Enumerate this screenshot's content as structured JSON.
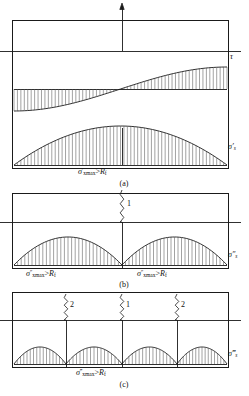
{
  "figure": {
    "title_visible": false,
    "stroke_color": "#1a1a1a",
    "hatch_color": "#555555",
    "background": "#ffffff",
    "panels": [
      {
        "id": "a",
        "caption": "(a)",
        "box": {
          "x": 12,
          "y": 20,
          "w": 216,
          "h": 148
        },
        "axis_y": 51,
        "axis_extends_left_to": 0,
        "axis_extends_right_to": 241,
        "vertical_arrow": {
          "x": 122,
          "top": 3,
          "bottom": 51,
          "head": "up"
        },
        "right_labels": [
          {
            "name": "tau-label",
            "text": "τ",
            "x": 231,
            "y": 57
          },
          {
            "name": "sigma-prime-s-label",
            "text": "σ′s",
            "x": 229,
            "y": 148
          }
        ],
        "bottom_label": {
          "name": "sigma-prime-xmax-label",
          "text": "σ′xmax>Rf",
          "x": 124,
          "y": 172
        },
        "diagrams": [
          {
            "type": "shear-s-curve",
            "name": "tau-diagram",
            "baseline_y": 89,
            "amplitude": 22,
            "x_start": 14,
            "x_end": 227,
            "hatch_count": 62,
            "description": "antisymmetric S-shaped shear stress curve hatched to baseline"
          },
          {
            "type": "parabola-arch",
            "name": "sigma-x-diagram",
            "baseline_y": 165,
            "peak_y": 126,
            "x_start": 14,
            "x_end": 227,
            "hatch_count": 62,
            "center_tick": true,
            "description": "single parabolic normal stress arch hatched down to bottom edge"
          }
        ],
        "cracks": []
      },
      {
        "id": "b",
        "caption": "(b)",
        "box": {
          "x": 12,
          "y": 193,
          "w": 216,
          "h": 75
        },
        "axis_y": 222,
        "axis_extends_left_to": 0,
        "axis_extends_right_to": 241,
        "center_line": {
          "x": 122,
          "top": 222,
          "bottom": 268
        },
        "right_labels": [
          {
            "name": "sigma-dprime-s-label",
            "text": "σ″s",
            "x": 229,
            "y": 256
          }
        ],
        "bottom_labels": [
          {
            "name": "sigma-dprime-xmax-label-left",
            "text": "σ″xmax>Rf",
            "x": 66,
            "y": 274
          },
          {
            "name": "sigma-dprime-xmax-label-right",
            "text": "σ″xmax>Rf",
            "x": 178,
            "y": 274
          }
        ],
        "diagrams": [
          {
            "type": "parabola-arch-pair",
            "name": "sigma-x-diagram",
            "baseline_y": 265,
            "peak_y": 237,
            "x_start": 14,
            "x_mid": 122,
            "x_end": 227,
            "hatch_count": 30,
            "description": "two parabolic arches meeting at mid-span crack"
          }
        ],
        "cracks": [
          {
            "name": "crack-1",
            "label": "1",
            "x": 122,
            "top": 190,
            "bottom": 222,
            "label_x": 128,
            "label_y": 205
          }
        ]
      },
      {
        "id": "c",
        "caption": "(c)",
        "box": {
          "x": 12,
          "y": 292,
          "w": 216,
          "h": 75
        },
        "axis_y": 320,
        "axis_extends_left_to": 0,
        "axis_extends_right_to": 241,
        "center_lines": [
          {
            "x": 66,
            "top": 292,
            "bottom": 367
          },
          {
            "x": 122,
            "top": 292,
            "bottom": 367
          },
          {
            "x": 177,
            "top": 292,
            "bottom": 367
          }
        ],
        "right_labels": [
          {
            "name": "sigma-tprime-s-label",
            "text": "σ‴s",
            "x": 229,
            "y": 355
          }
        ],
        "bottom_label": {
          "name": "sigma-tprime-xmax-label",
          "text": "σ‴xmax>Rf",
          "x": 124,
          "y": 373
        },
        "diagrams": [
          {
            "type": "parabola-arch-quad",
            "name": "sigma-x-diagram",
            "baseline_y": 364,
            "peak_y": 347,
            "x_start": 14,
            "x_end": 227,
            "breakpoints": [
              66,
              122,
              177
            ],
            "hatch_count": 16,
            "description": "four small parabolic arches between cracks"
          }
        ],
        "cracks": [
          {
            "name": "crack-2-left",
            "label": "2",
            "x": 66,
            "top": 294,
            "bottom": 320,
            "label_x": 71,
            "label_y": 306
          },
          {
            "name": "crack-1-center",
            "label": "1",
            "x": 122,
            "top": 294,
            "bottom": 320,
            "label_x": 127,
            "label_y": 306
          },
          {
            "name": "crack-2-right",
            "label": "2",
            "x": 177,
            "top": 294,
            "bottom": 320,
            "label_x": 182,
            "label_y": 306
          }
        ]
      }
    ],
    "captions": [
      {
        "name": "caption-a",
        "text": "(a)",
        "x": 124,
        "y": 184
      },
      {
        "name": "caption-b",
        "text": "(b)",
        "x": 124,
        "y": 285
      },
      {
        "name": "caption-c",
        "text": "(c)",
        "x": 124,
        "y": 385
      }
    ],
    "symbols": {
      "sigma": "σ",
      "tau": "τ",
      "prime": "′",
      "gt": ">",
      "R": "R",
      "f": "f",
      "xmax": "xmax",
      "s": "s"
    }
  }
}
